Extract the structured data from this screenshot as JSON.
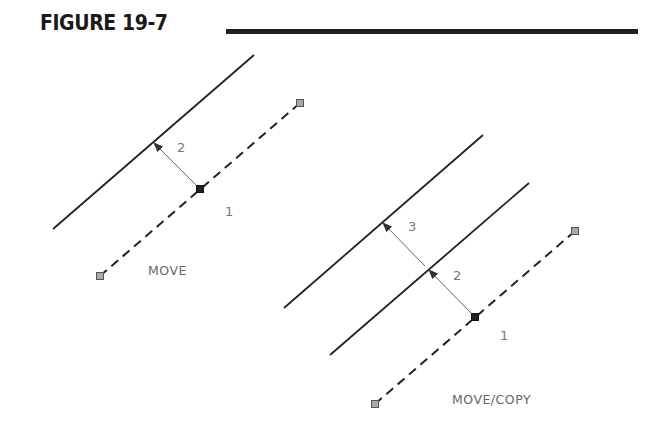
{
  "figure": {
    "title": "FIGURE 19-7"
  },
  "colors": {
    "line": "#222222",
    "arrow": "#666666",
    "grip_fill": "#a8a8a8",
    "grip_stroke": "#555555",
    "base_grip": "#222222",
    "label": "#777777"
  },
  "panels": [
    {
      "caption": "MOVE",
      "solid_lines": [
        {
          "x1": 53,
          "y1": 229,
          "x2": 254,
          "y2": 55
        }
      ],
      "dashed_line": {
        "x1": 100,
        "y1": 276,
        "x2": 300,
        "y2": 103
      },
      "end_grips": [
        {
          "x": 100,
          "y": 276
        },
        {
          "x": 300,
          "y": 103
        }
      ],
      "base_grip": {
        "x": 200,
        "y": 189
      },
      "arrows": [
        {
          "from": [
            196,
            185
          ],
          "to": [
            154,
            143
          ],
          "label": "2",
          "label_pos": [
            177,
            152
          ]
        }
      ],
      "point_labels": [
        {
          "text": "1",
          "x": 225,
          "y": 216
        }
      ],
      "caption_pos": [
        148,
        275
      ]
    },
    {
      "caption": "MOVE/COPY",
      "solid_lines": [
        {
          "x1": 284,
          "y1": 308,
          "x2": 483,
          "y2": 135
        },
        {
          "x1": 330,
          "y1": 355,
          "x2": 529,
          "y2": 183
        }
      ],
      "dashed_line": {
        "x1": 375,
        "y1": 404,
        "x2": 575,
        "y2": 231
      },
      "end_grips": [
        {
          "x": 375,
          "y": 404
        },
        {
          "x": 575,
          "y": 231
        }
      ],
      "base_grip": {
        "x": 475,
        "y": 317
      },
      "arrows": [
        {
          "from": [
            471,
            313
          ],
          "to": [
            429,
            270
          ],
          "label": "2",
          "label_pos": [
            453,
            280
          ]
        },
        {
          "from": [
            425,
            266
          ],
          "to": [
            383,
            223
          ],
          "label": "3",
          "label_pos": [
            408,
            231
          ]
        }
      ],
      "point_labels": [
        {
          "text": "1",
          "x": 500,
          "y": 340
        }
      ],
      "caption_pos": [
        452,
        404
      ]
    }
  ]
}
